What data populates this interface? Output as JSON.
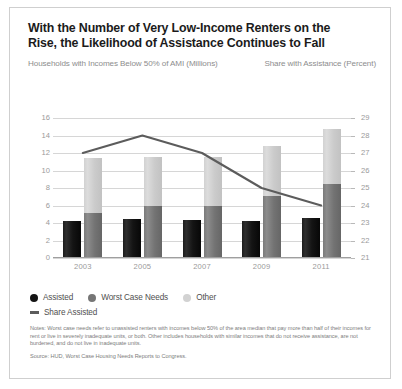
{
  "header": {
    "title": "With the Number of Very Low-Income Renters on the Rise, the Likelihood of Assistance Continues to Fall",
    "left_axis_caption": "Households with Incomes Below 50% of AMI (Millions)",
    "right_axis_caption": "Share with Assistance (Percent)"
  },
  "footer": {
    "notes": "Notes: Worst case needs refer to unassisted renters with incomes below 50% of the area median that pay more than half of their incomes for rent or live in severely inadequate units, or both. Other includes households with similar incomes that do not receive assistance, are not burdened, and do not live in inadequate units.",
    "source": "Source: HUD, Worst Case Housing Needs Reports to Congress."
  },
  "colors": {
    "assisted": "#141414",
    "worst_case": "#767676",
    "other": "#d2d2d2",
    "share_line": "#5c5c5c",
    "grid": "#d6d6d6",
    "axis_text": "#9a9a9a",
    "caption_text": "#8d8d8d",
    "title_text": "#1b1b1b",
    "card_border": "#cfcfcf"
  },
  "chart_data": {
    "type": "bar",
    "title": "With the Number of Very Low-Income Renters on the Rise, the Likelihood of Assistance Continues to Fall",
    "xlabel": "",
    "ylabel": "Households with Incomes Below 50% of AMI (Millions)",
    "y2label": "Share with Assistance (Percent)",
    "categories": [
      "2003",
      "2005",
      "2007",
      "2009",
      "2011"
    ],
    "ylim": [
      0,
      16
    ],
    "yticks": [
      0,
      2,
      4,
      6,
      8,
      10,
      12,
      14,
      16
    ],
    "y2lim": [
      21,
      29
    ],
    "y2ticks": [
      21,
      22,
      23,
      24,
      25,
      26,
      27,
      28,
      29
    ],
    "grid": true,
    "legend_position": "bottom-left",
    "stacked": true,
    "series": [
      {
        "name": "Assisted",
        "type": "bar",
        "axis": "left",
        "color": "#141414",
        "values": [
          4.2,
          4.5,
          4.3,
          4.25,
          4.6
        ]
      },
      {
        "name": "Worst Case Needs",
        "type": "bar-stacked",
        "axis": "left",
        "color": "#767676",
        "values": [
          5.1,
          6.0,
          5.9,
          7.1,
          8.5
        ]
      },
      {
        "name": "Other",
        "type": "bar-stacked",
        "axis": "left",
        "color": "#d2d2d2",
        "values": [
          6.3,
          5.5,
          5.7,
          5.7,
          6.3
        ]
      },
      {
        "name": "Share Assisted",
        "type": "line",
        "axis": "right",
        "color": "#5c5c5c",
        "values": [
          27.0,
          28.0,
          27.0,
          25.0,
          24.0
        ]
      }
    ],
    "stack_totals": [
      11.4,
      11.5,
      11.6,
      12.8,
      14.8
    ],
    "legend": [
      "Assisted",
      "Worst Case Needs",
      "Other",
      "Share Assisted"
    ]
  }
}
